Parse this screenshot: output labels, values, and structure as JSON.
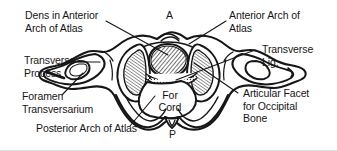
{
  "figure": {
    "background_color": "#ffffff",
    "ink_color": "#161616"
  },
  "labels": {
    "dens": {
      "line1": "Dens in Anterior",
      "line2": "Arch of Atlas"
    },
    "transverse_process": {
      "line1": "Transverse",
      "line2": "Process"
    },
    "foramen_transversarium": {
      "line1": "Foramen",
      "line2": "Transversarium"
    },
    "posterior_arch": {
      "line1": "Posterior Arch of Atlas"
    },
    "anterior_arch": {
      "line1": "Anterior Arch of",
      "line2": "Atlas"
    },
    "transverse_lig": {
      "line1": "Transverse",
      "line2": "Lig."
    },
    "articular_facet": {
      "line1": "Articular Facet",
      "line2": "for Occipital",
      "line3": "Bone"
    },
    "for_cord": {
      "line1": "For",
      "line2": "Cord"
    }
  },
  "markers": {
    "anterior": "A",
    "posterior": "P"
  }
}
